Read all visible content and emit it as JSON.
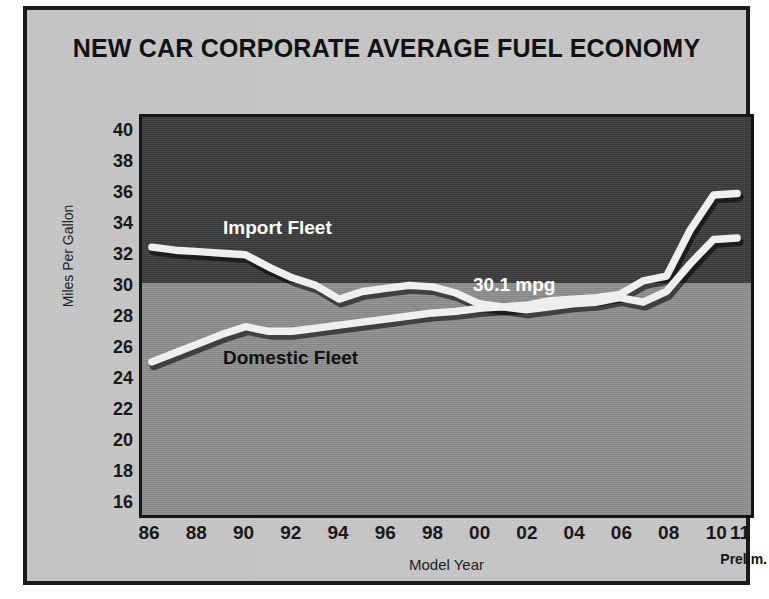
{
  "chart": {
    "title": "NEW CAR CORPORATE AVERAGE FUEL ECONOMY",
    "xlabel": "Model Year",
    "ylabel": "Miles Per Gallon",
    "prelim_note": "Prelim.",
    "annotation_mpg": "30.1 mpg",
    "series_label_import": "Import Fleet",
    "series_label_domestic": "Domestic Fleet"
  },
  "chart_data": {
    "type": "line",
    "title": "NEW CAR CORPORATE AVERAGE FUEL ECONOMY",
    "xlabel": "Model Year",
    "ylabel": "Miles Per Gallon",
    "ylim": [
      15,
      41
    ],
    "yticks": [
      40,
      38,
      36,
      34,
      32,
      30,
      28,
      26,
      24,
      22,
      20,
      18,
      16
    ],
    "xticks": [
      "86",
      "88",
      "90",
      "92",
      "94",
      "96",
      "98",
      "00",
      "02",
      "04",
      "06",
      "08",
      "10",
      "11"
    ],
    "grid": false,
    "legend": "inline-labels",
    "annotations": [
      {
        "text": "30.1 mpg",
        "value": 30.1,
        "note": "boundary between shaded bands"
      },
      {
        "text": "Prelim.",
        "note": "model year 11 is preliminary"
      }
    ],
    "bands": [
      {
        "from": 30.3,
        "to": 41,
        "color": "#3b3b3b"
      },
      {
        "from": 15,
        "to": 30.3,
        "color": "#919191"
      }
    ],
    "x": [
      1986,
      1987,
      1988,
      1989,
      1990,
      1991,
      1992,
      1993,
      1994,
      1995,
      1996,
      1997,
      1998,
      1999,
      2000,
      2001,
      2002,
      2003,
      2004,
      2005,
      2006,
      2007,
      2008,
      2009,
      2010,
      2011
    ],
    "series": [
      {
        "name": "Import Fleet",
        "color": "#efefef",
        "values": [
          32.5,
          32.3,
          32.2,
          32.1,
          32.0,
          31.2,
          30.5,
          30.0,
          29.1,
          29.6,
          29.8,
          30.0,
          29.9,
          29.5,
          28.8,
          28.6,
          28.7,
          29.0,
          29.1,
          29.2,
          29.4,
          30.3,
          30.6,
          33.6,
          35.9,
          36.0
        ]
      },
      {
        "name": "Domestic Fleet",
        "color": "#efefef",
        "values": [
          25.0,
          25.6,
          26.2,
          26.8,
          27.3,
          27.0,
          27.0,
          27.2,
          27.4,
          27.6,
          27.8,
          28.0,
          28.2,
          28.3,
          28.5,
          28.6,
          28.4,
          28.6,
          28.8,
          28.9,
          29.2,
          28.9,
          29.6,
          31.4,
          33.0,
          33.1
        ]
      }
    ]
  }
}
